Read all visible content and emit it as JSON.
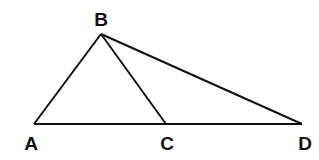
{
  "diagram": {
    "points": [
      {
        "name": "A",
        "x": 34,
        "y": 124,
        "lx": 31,
        "ly": 150
      },
      {
        "name": "B",
        "x": 101,
        "y": 34,
        "lx": 101,
        "ly": 26
      },
      {
        "name": "C",
        "x": 166,
        "y": 124,
        "lx": 167,
        "ly": 150
      },
      {
        "name": "D",
        "x": 302,
        "y": 124,
        "lx": 305,
        "ly": 150
      }
    ],
    "segments": [
      [
        "A",
        "B"
      ],
      [
        "B",
        "C"
      ],
      [
        "B",
        "D"
      ],
      [
        "A",
        "D"
      ]
    ],
    "stroke": "#111111"
  }
}
